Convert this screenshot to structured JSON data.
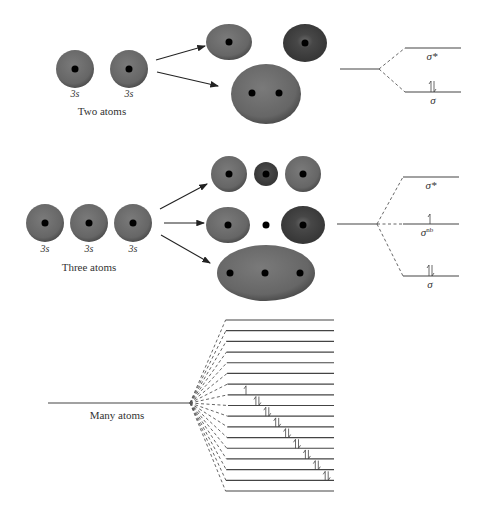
{
  "figure": {
    "sections": [
      {
        "id": "two-atoms",
        "caption": "Two atoms",
        "atomic_orbitals": [
          {
            "label": "3s",
            "cx": 75,
            "cy": 69
          },
          {
            "label": "3s",
            "cx": 129,
            "cy": 69
          }
        ],
        "molecular_orbitals": [
          {
            "name": "antibonding-lobe-a",
            "cx": 229,
            "cy": 42,
            "rx": 23,
            "ry": 18,
            "shade": "light",
            "nuclei": [
              [
                229,
                42
              ]
            ]
          },
          {
            "name": "antibonding-lobe-b",
            "cx": 305,
            "cy": 43,
            "rx": 22,
            "ry": 19,
            "shade": "dark",
            "nuclei": [
              [
                305,
                43
              ]
            ]
          },
          {
            "name": "bonding",
            "cx": 266,
            "cy": 94,
            "rx": 35,
            "ry": 30,
            "shade": "light",
            "nuclei": [
              [
                252,
                93
              ],
              [
                279,
                93
              ]
            ]
          }
        ],
        "levels": [
          {
            "label": "σ*",
            "sup": "",
            "y": 48,
            "electrons": 0
          },
          {
            "label": "σ",
            "sup": "",
            "y": 92,
            "electrons": 2
          }
        ]
      },
      {
        "id": "three-atoms",
        "caption": "Three atoms",
        "atomic_orbitals": [
          {
            "label": "3s",
            "cx": 45,
            "cy": 223
          },
          {
            "label": "3s",
            "cx": 89,
            "cy": 223
          },
          {
            "label": "3s",
            "cx": 133,
            "cy": 223
          }
        ],
        "molecular_orbitals": [
          {
            "name": "antibonding-left",
            "cx": 229,
            "cy": 174,
            "rx": 18,
            "ry": 18,
            "shade": "light",
            "nuclei": [
              [
                229,
                174
              ]
            ]
          },
          {
            "name": "antibonding-middle",
            "cx": 266,
            "cy": 174,
            "rx": 12,
            "ry": 12,
            "shade": "dark",
            "nuclei": [
              [
                266,
                174
              ]
            ]
          },
          {
            "name": "antibonding-right",
            "cx": 303,
            "cy": 174,
            "rx": 18,
            "ry": 18,
            "shade": "light",
            "nuclei": [
              [
                303,
                174
              ]
            ]
          },
          {
            "name": "nonbonding-left",
            "cx": 228,
            "cy": 225,
            "rx": 22,
            "ry": 18,
            "shade": "light",
            "nuclei": [
              [
                228,
                225
              ]
            ]
          },
          {
            "name": "nonbonding-node",
            "cx": 266,
            "cy": 225,
            "rx": 0,
            "ry": 0,
            "shade": "none",
            "nuclei": [
              [
                266,
                225
              ]
            ]
          },
          {
            "name": "nonbonding-right",
            "cx": 303,
            "cy": 225,
            "rx": 22,
            "ry": 19,
            "shade": "dark",
            "nuclei": [
              [
                303,
                225
              ]
            ]
          },
          {
            "name": "bonding",
            "cx": 266,
            "cy": 273,
            "rx": 49,
            "ry": 28,
            "shade": "light",
            "nuclei": [
              [
                230,
                273
              ],
              [
                265,
                273
              ],
              [
                300,
                273
              ]
            ]
          }
        ],
        "levels": [
          {
            "label": "σ*",
            "sup": "",
            "y": 177,
            "electrons": 0
          },
          {
            "label": "σ",
            "sup": "nb",
            "y": 224,
            "electrons": 1
          },
          {
            "label": "σ",
            "sup": "",
            "y": 276,
            "electrons": 2
          }
        ]
      },
      {
        "id": "many-atoms",
        "caption": "Many atoms",
        "level_count": 17,
        "filled_levels": 8,
        "half_filled_levels": 1
      }
    ],
    "colors": {
      "orbital_light": "#6e6e6e",
      "orbital_dark": "#4a4a4a",
      "nucleus": "#000000",
      "line": "#444444"
    }
  }
}
